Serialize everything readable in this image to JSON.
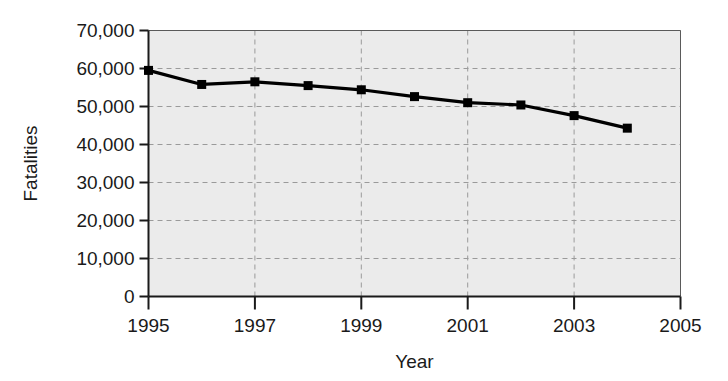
{
  "chart_data": {
    "type": "line",
    "title": "",
    "subtitle": "",
    "xlabel": "Year",
    "ylabel": "Fatalities",
    "x": [
      1995,
      1996,
      1997,
      1998,
      1999,
      2000,
      2001,
      2002,
      2003,
      2004
    ],
    "values": [
      59500,
      55800,
      56500,
      55500,
      54400,
      52600,
      51000,
      50400,
      47600,
      44300
    ],
    "series": [
      {
        "name": "Fatalities",
        "values": [
          59500,
          55800,
          56500,
          55500,
          54400,
          52600,
          51000,
          50400,
          47600,
          44300
        ]
      }
    ],
    "xlim": [
      1995,
      2005
    ],
    "ylim": [
      0,
      70000
    ],
    "xticks": [
      1995,
      1997,
      1999,
      2001,
      2003,
      2005
    ],
    "xtick_labels": [
      "1995",
      "1997",
      "1999",
      "2001",
      "2003",
      "2005"
    ],
    "yticks": [
      0,
      10000,
      20000,
      30000,
      40000,
      50000,
      60000,
      70000
    ],
    "ytick_labels": [
      "0",
      "10,000",
      "20,000",
      "30,000",
      "40,000",
      "50,000",
      "60,000",
      "70,000"
    ],
    "grid": true,
    "grid_style": "dashed",
    "legend": false,
    "legend_position": "none",
    "marker": "square",
    "line_color": "#000000",
    "marker_color": "#000000",
    "plot_background_color": "#ebebeb",
    "grid_color": "#9a9a9a",
    "axis_color": "#1a1a1a",
    "figure_background_color": "#ffffff"
  }
}
